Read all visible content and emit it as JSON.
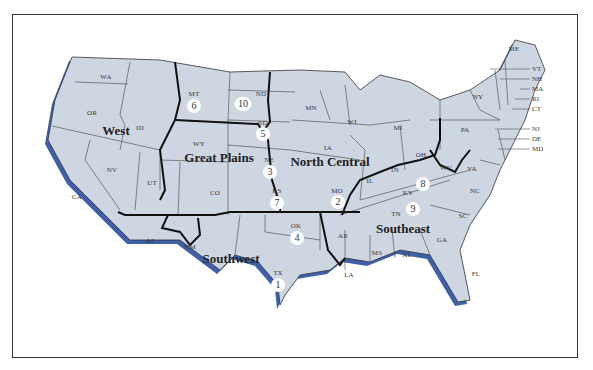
{
  "map": {
    "title": "",
    "fill_color": "#ced6e2",
    "shadow_color": "#3f5fa8",
    "state_border_color": "#333333",
    "region_border_color": "#111111",
    "regions": [
      {
        "name": "West"
      },
      {
        "name": "Great Plains"
      },
      {
        "name": "North Central"
      },
      {
        "name": "Southwest"
      },
      {
        "name": "Southeast"
      }
    ],
    "states": {
      "WA": "WA",
      "OR": "OR",
      "CA": "CA",
      "ID": "ID",
      "NV": "NV",
      "UT": "UT",
      "AZ": "AZ",
      "MT": "MT",
      "WY": "WY",
      "CO": "CO",
      "NM": "NM",
      "ND": "ND",
      "SD": "SD",
      "NE": "NE",
      "KS": "KS",
      "OK": "OK",
      "TX": "TX",
      "MN": "MN",
      "IA": "IA",
      "MO": "MO",
      "WI": "WI",
      "IL": "IL",
      "MI": "MI",
      "IN": "IN",
      "OH": "OH",
      "AR": "AR",
      "LA": "LA",
      "MS": "MS",
      "AL": "AL",
      "TN": "TN",
      "KY": "KY",
      "GA": "GA",
      "FL": "FL",
      "SC": "SC",
      "NC": "NC",
      "VA": "VA",
      "WV": "WV",
      "PA": "PA",
      "NY": "NY",
      "ME": "ME",
      "VT": "VT",
      "NH": "NH",
      "MA": "MA",
      "RI": "RI",
      "CT": "CT",
      "NJ": "NJ",
      "DE": "DE",
      "MD": "MD"
    },
    "ranks": [
      {
        "state": "TX",
        "rank": "1"
      },
      {
        "state": "MO",
        "rank": "2"
      },
      {
        "state": "NE",
        "rank": "3"
      },
      {
        "state": "OK",
        "rank": "4"
      },
      {
        "state": "SD",
        "rank": "5"
      },
      {
        "state": "MT",
        "rank": "6"
      },
      {
        "state": "KS",
        "rank": "7"
      },
      {
        "state": "KY",
        "rank": "8"
      },
      {
        "state": "TN",
        "rank": "9"
      },
      {
        "state": "ND",
        "rank": "10"
      }
    ]
  }
}
